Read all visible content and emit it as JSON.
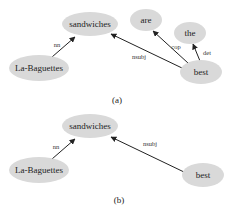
{
  "colors": {
    "node_fill": "#d9d9d9",
    "edge": "#222222",
    "text": "#222222"
  },
  "diagrams": [
    {
      "caption": "(a)",
      "nodes": {
        "sandwiches": "sandwiches",
        "are": "are",
        "the": "the",
        "la_baguettes": "La-Baguettes",
        "best": "best"
      },
      "edges": {
        "nn": "nn",
        "nsubj": "nsubj",
        "cop": "cop",
        "det": "det"
      }
    },
    {
      "caption": "(b)",
      "nodes": {
        "sandwiches": "sandwiches",
        "la_baguettes": "La-Baguettes",
        "best": "best"
      },
      "edges": {
        "nn": "nn",
        "nsubj": "nsubj"
      }
    }
  ]
}
